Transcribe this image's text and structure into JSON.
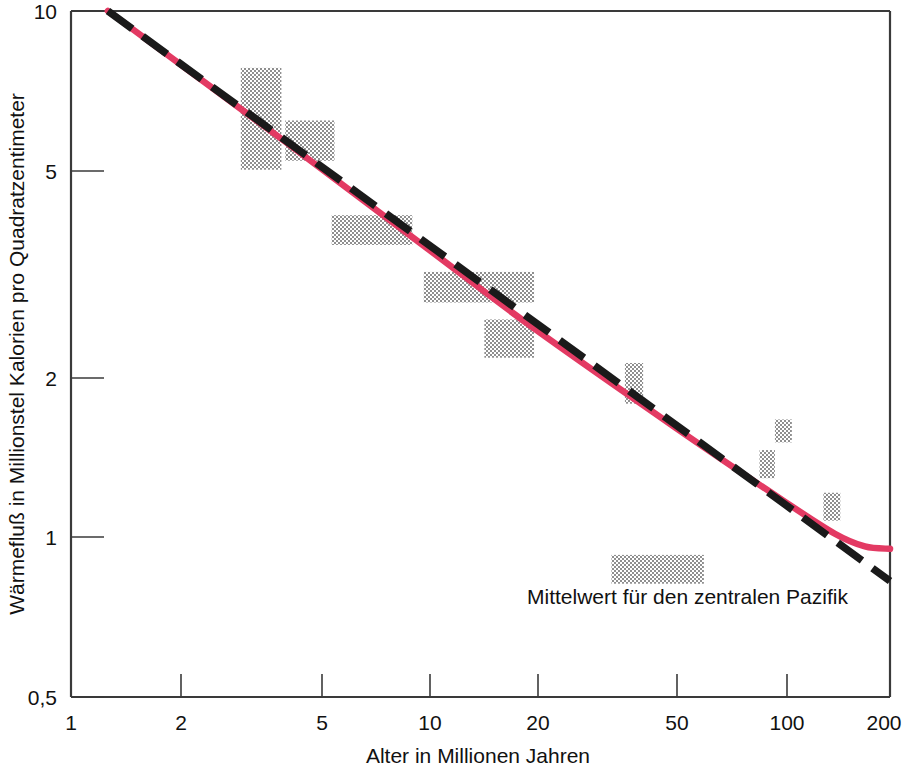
{
  "chart_data": {
    "type": "scatter",
    "title": "",
    "xlabel": "Alter in Millionen Jahren",
    "ylabel": "Wärmefluß in Millionstel Kalorien pro Quadratzentimeter",
    "xscale": "log",
    "yscale": "log",
    "xlim": [
      1,
      200
    ],
    "ylim": [
      0.5,
      10
    ],
    "xticks": [
      "1",
      "2",
      "5",
      "10",
      "20",
      "50",
      "100",
      "200"
    ],
    "xtick_values": [
      1,
      2,
      5,
      10,
      20,
      50,
      100,
      200
    ],
    "yticks": [
      "10",
      "5",
      "2",
      "1",
      "0,5"
    ],
    "ytick_values": [
      10,
      5,
      2,
      1,
      0.5
    ],
    "grid": false,
    "legend_position": "none",
    "annotations": [
      {
        "name": "central-pacific-mean",
        "text": "Mittelwert für den zentralen Pazifik",
        "x": 40,
        "y": 0.78
      }
    ],
    "series": [
      {
        "name": "Messbereiche (Datenkästen)",
        "type": "boxes",
        "style": "stippled-gray",
        "color": "#a8a8a8",
        "boxes": [
          {
            "label": "box-1",
            "x_range": [
              3.0,
              3.9
            ],
            "y_range": [
              5.0,
              7.8
            ]
          },
          {
            "label": "box-2",
            "x_range": [
              4.0,
              5.5
            ],
            "y_range": [
              5.2,
              6.2
            ]
          },
          {
            "label": "box-3",
            "x_range": [
              5.4,
              9.1
            ],
            "y_range": [
              3.6,
              4.1
            ]
          },
          {
            "label": "box-4",
            "x_range": [
              9.8,
              20.0
            ],
            "y_range": [
              2.8,
              3.2
            ]
          },
          {
            "label": "box-5",
            "x_range": [
              14.5,
              20.0
            ],
            "y_range": [
              2.2,
              2.6
            ]
          },
          {
            "label": "box-6",
            "x_range": [
              36.0,
              40.5
            ],
            "y_range": [
              1.8,
              2.15
            ]
          },
          {
            "label": "box-7",
            "x_range": [
              95.0,
              106.0
            ],
            "y_range": [
              1.52,
              1.68
            ]
          },
          {
            "label": "box-8",
            "x_range": [
              86.0,
              95.0
            ],
            "y_range": [
              1.3,
              1.47
            ]
          },
          {
            "label": "box-9",
            "x_range": [
              130.0,
              145.0
            ],
            "y_range": [
              1.08,
              1.22
            ]
          },
          {
            "label": "box-10-pacific-mean",
            "x_range": [
              33.0,
              60.0
            ],
            "y_range": [
              0.82,
              0.93
            ]
          }
        ]
      },
      {
        "name": "Theoretische Kurve",
        "type": "line",
        "style": "solid",
        "color": "#e33a63",
        "points": [
          {
            "x": 1.27,
            "y": 10.0
          },
          {
            "x": 4.0,
            "y": 5.65
          },
          {
            "x": 10.0,
            "y": 3.55
          },
          {
            "x": 20.0,
            "y": 2.5
          },
          {
            "x": 50.0,
            "y": 1.62
          },
          {
            "x": 100.0,
            "y": 1.18
          },
          {
            "x": 140.0,
            "y": 1.02
          },
          {
            "x": 170.0,
            "y": 0.965
          },
          {
            "x": 200.0,
            "y": 0.955
          }
        ]
      },
      {
        "name": "Wurzel-Zeit-Gerade",
        "type": "line",
        "style": "dashed",
        "color": "#1a1a1a",
        "points": [
          {
            "x": 1.27,
            "y": 10.0
          },
          {
            "x": 200.0,
            "y": 0.83
          }
        ]
      }
    ]
  },
  "axes": {
    "x_title": "Alter in Millionen Jahren",
    "y_title": "Wärmefluß in Millionstel Kalorien pro Quadratzentimeter"
  },
  "colors": {
    "curve_red": "#e33a63",
    "line_black": "#1a1a1a",
    "box_gray": "#a8a8a8",
    "axis": "#3a3a3a",
    "text": "#111111"
  }
}
